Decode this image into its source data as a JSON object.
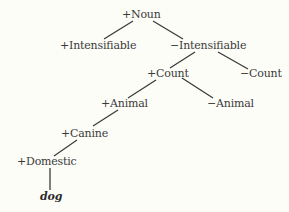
{
  "diagram": {
    "type": "feature tree",
    "nodes": {
      "noun": "+Noun",
      "plus_intensifiable": "+Intensifiable",
      "minus_intensifiable": "−Intensifiable",
      "plus_count": "+Count",
      "minus_count": "−Count",
      "plus_animal": "+Animal",
      "minus_animal": "−Animal",
      "plus_canine": "+Canine",
      "plus_domestic": "+Domestic",
      "dog": "dog"
    },
    "edges": [
      [
        "+Noun",
        "+Intensifiable"
      ],
      [
        "+Noun",
        "−Intensifiable"
      ],
      [
        "−Intensifiable",
        "+Count"
      ],
      [
        "−Intensifiable",
        "−Count"
      ],
      [
        "+Count",
        "+Animal"
      ],
      [
        "+Count",
        "−Animal"
      ],
      [
        "+Animal",
        "+Canine"
      ],
      [
        "+Canine",
        "+Domestic"
      ],
      [
        "+Domestic",
        "dog"
      ]
    ]
  }
}
